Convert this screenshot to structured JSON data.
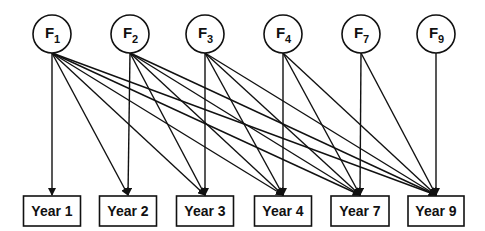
{
  "diagram": {
    "type": "path-diagram",
    "factors": [
      {
        "id": "F1",
        "letter": "F",
        "sub": "1"
      },
      {
        "id": "F2",
        "letter": "F",
        "sub": "2"
      },
      {
        "id": "F3",
        "letter": "F",
        "sub": "3"
      },
      {
        "id": "F4",
        "letter": "F",
        "sub": "4"
      },
      {
        "id": "F7",
        "letter": "F",
        "sub": "7"
      },
      {
        "id": "F9",
        "letter": "F",
        "sub": "9"
      }
    ],
    "years": [
      {
        "id": "Y1",
        "label": "Year 1"
      },
      {
        "id": "Y2",
        "label": "Year 2"
      },
      {
        "id": "Y3",
        "label": "Year 3"
      },
      {
        "id": "Y4",
        "label": "Year 4"
      },
      {
        "id": "Y7",
        "label": "Year 7"
      },
      {
        "id": "Y9",
        "label": "Year 9"
      }
    ],
    "edges": [
      [
        "F1",
        "Y1"
      ],
      [
        "F1",
        "Y2"
      ],
      [
        "F1",
        "Y3"
      ],
      [
        "F1",
        "Y4"
      ],
      [
        "F1",
        "Y7"
      ],
      [
        "F1",
        "Y9"
      ],
      [
        "F2",
        "Y2"
      ],
      [
        "F2",
        "Y3"
      ],
      [
        "F2",
        "Y4"
      ],
      [
        "F2",
        "Y7"
      ],
      [
        "F2",
        "Y9"
      ],
      [
        "F3",
        "Y3"
      ],
      [
        "F3",
        "Y4"
      ],
      [
        "F3",
        "Y7"
      ],
      [
        "F3",
        "Y9"
      ],
      [
        "F4",
        "Y4"
      ],
      [
        "F4",
        "Y7"
      ],
      [
        "F4",
        "Y9"
      ],
      [
        "F7",
        "Y7"
      ],
      [
        "F7",
        "Y9"
      ],
      [
        "F9",
        "Y9"
      ]
    ],
    "colors": {
      "stroke": "#111111",
      "background": "#ffffff"
    }
  }
}
